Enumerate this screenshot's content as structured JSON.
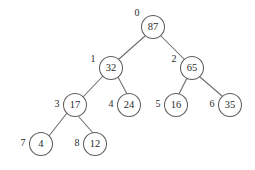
{
  "diagram": {
    "type": "binary-heap-tree",
    "background_color": "#ffffff",
    "node_stroke_color": "#5f5f5f",
    "edge_stroke_color": "#6b6b6b",
    "text_color": "#2b2b2b",
    "node_radius": 11.5,
    "nodes": [
      {
        "index": "0",
        "value": "87",
        "cx": 153,
        "cy": 27,
        "label_x": 137,
        "label_y": 14
      },
      {
        "index": "1",
        "value": "32",
        "cx": 111,
        "cy": 68,
        "label_x": 93,
        "label_y": 60
      },
      {
        "index": "2",
        "value": "65",
        "cx": 192,
        "cy": 68,
        "label_x": 174,
        "label_y": 60
      },
      {
        "index": "3",
        "value": "17",
        "cx": 75,
        "cy": 105,
        "label_x": 57,
        "label_y": 105
      },
      {
        "index": "4",
        "value": "24",
        "cx": 129,
        "cy": 105,
        "label_x": 111,
        "label_y": 105
      },
      {
        "index": "5",
        "value": "16",
        "cx": 176,
        "cy": 105,
        "label_x": 158,
        "label_y": 105
      },
      {
        "index": "6",
        "value": "35",
        "cx": 230,
        "cy": 105,
        "label_x": 212,
        "label_y": 105
      },
      {
        "index": "7",
        "value": "4",
        "cx": 41,
        "cy": 144,
        "label_x": 23,
        "label_y": 144
      },
      {
        "index": "8",
        "value": "12",
        "cx": 95,
        "cy": 144,
        "label_x": 77,
        "label_y": 144
      }
    ],
    "edges": [
      {
        "from": "0",
        "to": "1",
        "x1": 145,
        "y1": 36,
        "x2": 119,
        "y2": 59
      },
      {
        "from": "0",
        "to": "2",
        "x1": 161,
        "y1": 36,
        "x2": 184,
        "y2": 59
      },
      {
        "from": "1",
        "to": "3",
        "x1": 103,
        "y1": 76,
        "x2": 83,
        "y2": 97
      },
      {
        "from": "1",
        "to": "4",
        "x1": 118,
        "y1": 77,
        "x2": 127,
        "y2": 94
      },
      {
        "from": "2",
        "to": "5",
        "x1": 187,
        "y1": 78,
        "x2": 179,
        "y2": 94
      },
      {
        "from": "2",
        "to": "6",
        "x1": 200,
        "y1": 77,
        "x2": 222,
        "y2": 96
      },
      {
        "from": "3",
        "to": "7",
        "x1": 67,
        "y1": 113,
        "x2": 49,
        "y2": 136
      },
      {
        "from": "3",
        "to": "8",
        "x1": 79,
        "y1": 117,
        "x2": 93,
        "y2": 133
      }
    ]
  }
}
